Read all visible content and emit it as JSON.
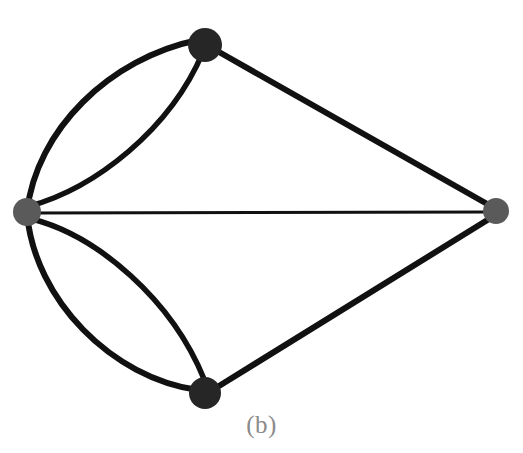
{
  "figure": {
    "caption": "(b)",
    "caption_color": "#8a8a8a",
    "background_color": "#ffffff",
    "width": 523,
    "height": 453
  },
  "chart_data": {
    "type": "diagram",
    "diagram_kind": "multigraph",
    "title": "(b)",
    "background": "#ffffff",
    "node_count": 4,
    "edge_count": 7,
    "nodes": [
      {
        "id": "left",
        "label": "",
        "x": 27,
        "y": 212,
        "r": 14,
        "fill": "#5a5a5a",
        "shade": "gray",
        "degree": 5
      },
      {
        "id": "top",
        "label": "",
        "x": 205,
        "y": 45,
        "r": 17,
        "fill": "#262626",
        "shade": "dark",
        "degree": 3
      },
      {
        "id": "bottom",
        "label": "",
        "x": 205,
        "y": 393,
        "r": 16,
        "fill": "#262626",
        "shade": "dark",
        "degree": 3
      },
      {
        "id": "right",
        "label": "",
        "x": 496,
        "y": 211,
        "r": 13,
        "fill": "#5a5a5a",
        "shade": "gray",
        "degree": 3
      }
    ],
    "edges": [
      {
        "id": "e1",
        "source": "left",
        "target": "top",
        "style": "curved",
        "curve": "outer-upper",
        "stroke": "#111111",
        "width": 6,
        "path": "M 27 212 C 36 130 110 58 198 40"
      },
      {
        "id": "e2",
        "source": "left",
        "target": "top",
        "style": "curved",
        "curve": "inner-upper",
        "stroke": "#111111",
        "width": 5.5,
        "path": "M 30 206 C 95 188 170 130 203 52"
      },
      {
        "id": "e3",
        "source": "left",
        "target": "bottom",
        "style": "curved",
        "curve": "outer-lower",
        "stroke": "#111111",
        "width": 6,
        "path": "M 27 214 C 35 300 112 378 198 390"
      },
      {
        "id": "e4",
        "source": "left",
        "target": "bottom",
        "style": "curved",
        "curve": "inner-lower",
        "stroke": "#111111",
        "width": 5.5,
        "path": "M 32 219 C 98 236 172 300 204 379"
      },
      {
        "id": "e5",
        "source": "left",
        "target": "right",
        "style": "straight",
        "curve": "none",
        "stroke": "#111111",
        "width": 3.2,
        "path": "M 33 213 L 488 212"
      },
      {
        "id": "e6",
        "source": "top",
        "target": "right",
        "style": "straight",
        "curve": "none",
        "stroke": "#111111",
        "width": 6,
        "path": "M 219 52 L 489 205"
      },
      {
        "id": "e7",
        "source": "bottom",
        "target": "right",
        "style": "straight",
        "curve": "none",
        "stroke": "#111111",
        "width": 6,
        "path": "M 219 386 L 489 219"
      }
    ],
    "adjacency_summary": [
      {
        "pair": "left-top",
        "multiplicity": 2
      },
      {
        "pair": "left-bottom",
        "multiplicity": 2
      },
      {
        "pair": "left-right",
        "multiplicity": 1
      },
      {
        "pair": "top-right",
        "multiplicity": 1
      },
      {
        "pair": "bottom-right",
        "multiplicity": 1
      }
    ]
  }
}
